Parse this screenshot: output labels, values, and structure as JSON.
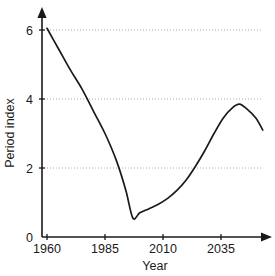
{
  "chart_data": {
    "type": "line",
    "title": "",
    "xlabel": "Year",
    "ylabel": "Period index",
    "xlim": [
      1960,
      2060
    ],
    "ylim": [
      0,
      6.5
    ],
    "grid": true,
    "legend": false,
    "x_ticks": [
      1960,
      1985,
      2010,
      2035
    ],
    "x_tick_labels": [
      "1960",
      "1985",
      "2010",
      "2035"
    ],
    "y_ticks": [
      0,
      2,
      4,
      6
    ],
    "y_tick_labels": [
      "0",
      "2",
      "4",
      "6"
    ],
    "gridlines_y": [
      2,
      4,
      6
    ],
    "series": [
      {
        "name": "Period index",
        "color": "#1a1a1a",
        "x": [
          1960,
          1965,
          1970,
          1975,
          1980,
          1985,
          1990,
          1994,
          1997,
          2000,
          2004,
          2008,
          2012,
          2016,
          2020,
          2024,
          2028,
          2032,
          2036,
          2040,
          2043,
          2046,
          2050,
          2053
        ],
        "y": [
          6.05,
          5.45,
          4.85,
          4.3,
          3.65,
          3.0,
          2.2,
          1.35,
          0.55,
          0.7,
          0.82,
          0.95,
          1.12,
          1.35,
          1.65,
          2.05,
          2.5,
          3.0,
          3.45,
          3.75,
          3.85,
          3.72,
          3.45,
          3.1
        ]
      }
    ],
    "annotations": {
      "start_value": 6.05,
      "minimum_value": 0.55,
      "minimum_year": 1997,
      "peak_value": 3.85,
      "peak_year": 2043,
      "end_value": 3.1,
      "end_year": 2053
    },
    "axis_arrows": {
      "y_axis_arrow": "up-arrow-icon",
      "x_axis_arrow": "right-arrow-icon"
    }
  }
}
